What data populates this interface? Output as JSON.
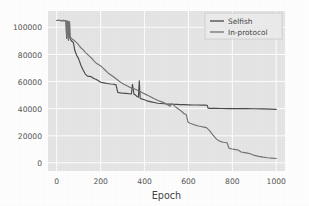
{
  "chart_data": {
    "type": "line",
    "title": "",
    "subtitle": "",
    "xlabel": "Epoch",
    "ylabel": "",
    "xlim": [
      -40,
      1040
    ],
    "ylim": [
      -6000,
      112000
    ],
    "xticks": [
      0,
      200,
      400,
      600,
      800,
      1000
    ],
    "xticklabels": [
      "0",
      "200",
      "400",
      "600",
      "800",
      "1000"
    ],
    "yticks": [
      0,
      20000,
      40000,
      60000,
      80000,
      100000
    ],
    "yticklabels": [
      "0",
      "20000",
      "40000",
      "60000",
      "80000",
      "100000"
    ],
    "grid": true,
    "grid_color": "#ffffff",
    "plot_bg": "#e6e6e6",
    "figure_bg": "#ffffff",
    "legend_position": "upper right",
    "series": [
      {
        "name": "Selfish",
        "color": "#4a4a4a",
        "x": [
          0,
          10,
          20,
          30,
          38,
          42,
          45,
          48,
          50,
          53,
          56,
          58,
          60,
          64,
          70,
          76,
          82,
          90,
          100,
          110,
          120,
          130,
          140,
          150,
          158,
          165,
          172,
          180,
          190,
          200,
          215,
          230,
          245,
          260,
          270,
          278,
          282,
          290,
          300,
          315,
          330,
          340,
          345,
          352,
          358,
          365,
          372,
          376,
          380,
          390,
          400,
          415,
          430,
          445,
          460,
          475,
          490,
          500,
          515,
          530,
          545,
          560,
          580,
          600,
          620,
          640,
          660,
          675,
          685,
          690,
          700,
          720,
          750,
          780,
          820,
          860,
          900,
          940,
          975,
          1000
        ],
        "y": [
          105000,
          105200,
          104800,
          105000,
          104800,
          104600,
          92000,
          104500,
          104300,
          90500,
          104000,
          103600,
          92000,
          90500,
          89500,
          88500,
          83000,
          79500,
          76500,
          72000,
          68500,
          65500,
          64000,
          63800,
          63500,
          62500,
          62000,
          61500,
          60500,
          59500,
          59000,
          58500,
          58200,
          58000,
          57500,
          52000,
          51800,
          51600,
          51400,
          51200,
          51000,
          50800,
          58000,
          50500,
          50200,
          49000,
          48500,
          60500,
          47500,
          47000,
          46500,
          45500,
          45000,
          44500,
          44000,
          43800,
          43600,
          43400,
          43300,
          43200,
          43100,
          43000,
          42900,
          42800,
          42700,
          42650,
          42600,
          42550,
          42500,
          40300,
          40200,
          40150,
          40100,
          40050,
          40000,
          39950,
          39900,
          39800,
          39600,
          39500
        ]
      },
      {
        "name": "In-protocol",
        "color": "#737373",
        "x": [
          0,
          10,
          20,
          30,
          38,
          42,
          45,
          48,
          50,
          53,
          56,
          58,
          60,
          66,
          72,
          80,
          88,
          96,
          104,
          112,
          120,
          130,
          140,
          150,
          160,
          170,
          180,
          190,
          200,
          210,
          220,
          232,
          245,
          258,
          270,
          282,
          295,
          305,
          318,
          330,
          342,
          355,
          368,
          375,
          382,
          392,
          405,
          418,
          430,
          442,
          455,
          468,
          480,
          492,
          500,
          508,
          516,
          524,
          532,
          540,
          548,
          556,
          565,
          572,
          578,
          584,
          590,
          598,
          608,
          620,
          632,
          645,
          658,
          670,
          682,
          695,
          705,
          712,
          720,
          728,
          736,
          744,
          752,
          760,
          768,
          776,
          784,
          792,
          800,
          808,
          816,
          826,
          840,
          855,
          870,
          885,
          900,
          920,
          940,
          960,
          980,
          1000
        ],
        "y": [
          105000,
          105200,
          104900,
          105100,
          104900,
          104700,
          93000,
          104600,
          104400,
          91000,
          104200,
          103800,
          93000,
          92000,
          91000,
          90200,
          89000,
          87800,
          86000,
          84500,
          83500,
          81500,
          80000,
          78500,
          77000,
          75000,
          73500,
          72500,
          71500,
          70000,
          68500,
          66500,
          65000,
          63500,
          62000,
          60500,
          59000,
          58000,
          57000,
          56000,
          55000,
          54500,
          53500,
          53000,
          52500,
          51500,
          50500,
          49500,
          48500,
          47500,
          46500,
          45500,
          45000,
          44200,
          43200,
          42500,
          41800,
          43500,
          42800,
          41500,
          40500,
          39500,
          38500,
          37500,
          36500,
          36000,
          35500,
          30000,
          29200,
          28500,
          27800,
          27200,
          26800,
          26400,
          26000,
          24000,
          22000,
          20500,
          19000,
          17500,
          16500,
          16000,
          15500,
          15200,
          15000,
          14800,
          11000,
          10500,
          10200,
          10000,
          9800,
          9500,
          8000,
          7600,
          7200,
          6500,
          5500,
          4800,
          4200,
          3800,
          3500,
          3200
        ]
      }
    ]
  },
  "legend": {
    "entries": [
      {
        "label": "Selfish"
      },
      {
        "label": "In-protocol"
      }
    ]
  }
}
